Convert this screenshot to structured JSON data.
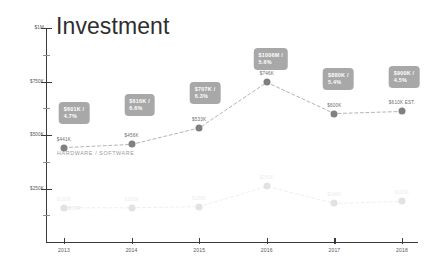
{
  "chart_data": {
    "type": "line",
    "title": "Investment",
    "xlabel": "",
    "ylabel": "",
    "categories": [
      "2013",
      "2014",
      "2015",
      "2016",
      "2017",
      "2018"
    ],
    "ylim": [
      0,
      1000000
    ],
    "ytick_labels": [
      "$250K",
      "$500K",
      "$750K",
      "$1M"
    ],
    "ytick_values": [
      250000,
      500000,
      750000,
      1000000
    ],
    "grid": false,
    "legend": "inline-series-labels",
    "series": [
      {
        "name": "HARDWARE / SOFTWARE",
        "point_labels": [
          "$441K",
          "$456K",
          "$533K",
          "$746K",
          "$600K",
          "$610K EST."
        ],
        "values": [
          441000,
          456000,
          533000,
          746000,
          600000,
          610000
        ]
      },
      {
        "name": "LABOR",
        "point_labels": [
          "$160K",
          "$160K",
          "$165K",
          "$260K",
          "$180K",
          "$190K"
        ],
        "values": [
          160000,
          160000,
          165000,
          260000,
          180000,
          190000
        ]
      }
    ],
    "annotations": [
      {
        "year": "2013",
        "amount": "$601K /",
        "percent": "4.7%"
      },
      {
        "year": "2014",
        "amount": "$616K /",
        "percent": "6.6%"
      },
      {
        "year": "2015",
        "amount": "$707K /",
        "percent": "6.3%"
      },
      {
        "year": "2016",
        "amount": "$1006M /",
        "percent": "5.6%"
      },
      {
        "year": "2017",
        "amount": "$880K /",
        "percent": "5.4%"
      },
      {
        "year": "2018",
        "amount": "$900K /",
        "percent": "4.5%"
      }
    ],
    "colors": {
      "callout_bg": "#a8a8a8",
      "callout_text": "#ffffff",
      "series_hardware": "#808080",
      "series_labor": "#e2e2e2",
      "axis": "#3a3a3a",
      "background": "#ffffff"
    }
  }
}
